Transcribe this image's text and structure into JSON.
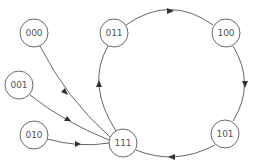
{
  "diagram": {
    "type": "state-transition-graph",
    "nodes": [
      {
        "id": "000",
        "label": "000",
        "cx": 34,
        "cy": 33
      },
      {
        "id": "001",
        "label": "001",
        "cx": 19,
        "cy": 85
      },
      {
        "id": "010",
        "label": "010",
        "cx": 34,
        "cy": 135
      },
      {
        "id": "011",
        "label": "011",
        "cx": 114,
        "cy": 33
      },
      {
        "id": "100",
        "label": "100",
        "cx": 226,
        "cy": 33
      },
      {
        "id": "101",
        "label": "101",
        "cx": 225,
        "cy": 134
      },
      {
        "id": "111",
        "label": "111",
        "cx": 123,
        "cy": 143
      }
    ],
    "edges": [
      {
        "from": "000",
        "to": "111"
      },
      {
        "from": "001",
        "to": "111"
      },
      {
        "from": "010",
        "to": "111"
      },
      {
        "from": "111",
        "to": "011"
      },
      {
        "from": "011",
        "to": "100"
      },
      {
        "from": "100",
        "to": "101"
      },
      {
        "from": "101",
        "to": "111"
      }
    ],
    "colors": {
      "stroke": "#555555",
      "node_border": "#6a6a6a",
      "label": "#555555",
      "background": "#ffffff"
    }
  }
}
